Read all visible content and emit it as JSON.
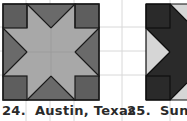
{
  "colors": {
    "grid_line": "#d8d8d8",
    "outline": "#1a1a1a",
    "austin_dark": "#5e5e5e",
    "austin_mid": "#6a6a6a",
    "austin_light": "#a8a8a8",
    "sunlight_dark": "#2a2a2a",
    "sunlight_light": "#d6d6d6"
  },
  "blocks": [
    {
      "number": "24.",
      "name": "Austin, Texas"
    },
    {
      "number": "25.",
      "name": "Sunlight"
    }
  ]
}
